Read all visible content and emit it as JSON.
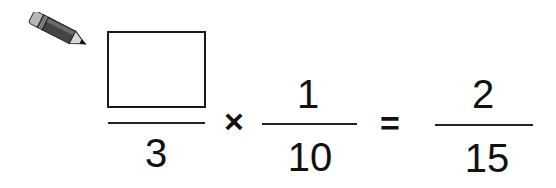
{
  "problem": {
    "icon": "pencil-icon",
    "operator": "×",
    "equals": "=",
    "fraction1": {
      "numerator": "",
      "denominator": "3",
      "numerator_is_blank_box": true
    },
    "fraction2": {
      "numerator": "1",
      "denominator": "10"
    },
    "result": {
      "numerator": "2",
      "denominator": "15"
    }
  }
}
